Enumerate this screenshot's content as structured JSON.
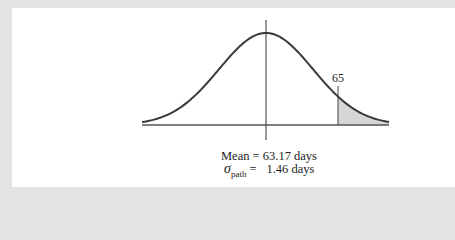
{
  "figure": {
    "tail_marker_label": "65",
    "mean_text": "Mean = 63.17 days",
    "sigma_symbol": "σ",
    "sigma_subscript": "path",
    "sigma_equals": "=",
    "sigma_value_text": "1.46 days"
  },
  "distribution": {
    "type": "normal",
    "mean_days": 63.17,
    "sigma_path_days": 1.46,
    "shaded_region": "x > 65 (right tail)",
    "marker_value": 65
  },
  "colors": {
    "background_outer": "#e4e4e4",
    "panel": "#ffffff",
    "curve": "#3a3a3a",
    "axis": "#555555",
    "shade": "#d6d6d6"
  },
  "geometry": {
    "center_x": 266,
    "sigma_px": 47,
    "peak_y": 33,
    "base_y": 125,
    "x_start": 142,
    "x_end": 389,
    "marker_x": 338,
    "marker_top_y": 86,
    "center_line_top": 20,
    "center_line_bottom": 140
  }
}
